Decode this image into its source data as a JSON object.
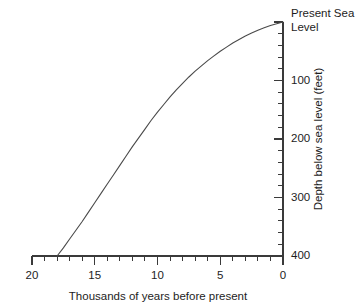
{
  "chart_data": {
    "type": "line",
    "title": "",
    "xlabel": "Thousands of years before present",
    "ylabel": "Depth below sea level (feet)",
    "xlim": [
      20,
      0
    ],
    "ylim": [
      400,
      0
    ],
    "x_reversed": true,
    "y_inverted": true,
    "grid": false,
    "legend": null,
    "x_ticks_major": [
      20,
      15,
      10,
      5,
      0
    ],
    "x_tick_labels": [
      "20",
      "15",
      "10",
      "5",
      "0"
    ],
    "x_tick_minor_step": 1,
    "y_ticks_major": [
      0,
      100,
      200,
      300,
      400
    ],
    "y_tick_labels": [
      "",
      "100",
      "200",
      "300",
      "400"
    ],
    "y_tick_minor_step": 20,
    "zero_annotation_line1": "Present Sea",
    "zero_annotation_line2": "Level",
    "series": [
      {
        "name": "Sea level curve",
        "x": [
          18.0,
          17.5,
          17.0,
          16.5,
          16.0,
          15.5,
          15.0,
          14.5,
          14.0,
          13.5,
          13.0,
          12.5,
          12.0,
          11.5,
          11.0,
          10.5,
          10.0,
          9.5,
          9.0,
          8.5,
          8.0,
          7.5,
          7.0,
          6.5,
          6.0,
          5.5,
          5.0,
          4.5,
          4.0,
          3.5,
          3.0,
          2.5,
          2.0,
          1.5,
          1.0,
          0.5,
          0.0
        ],
        "y": [
          400,
          386,
          371,
          356,
          341,
          325,
          309,
          293,
          277,
          261,
          245,
          229,
          213,
          198,
          183,
          168,
          154,
          141,
          128,
          116,
          105,
          94,
          84,
          75,
          66,
          58,
          50,
          43,
          36,
          30,
          24,
          19,
          14,
          10,
          6,
          3,
          0
        ]
      }
    ]
  },
  "geometry": {
    "plot_left": 32,
    "plot_right": 283,
    "plot_top": 22,
    "plot_bottom": 256
  }
}
